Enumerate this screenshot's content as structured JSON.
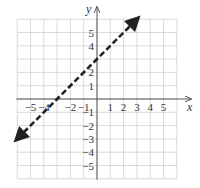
{
  "chart_data": {
    "type": "line",
    "title": "",
    "xlabel": "x",
    "ylabel": "y",
    "xlim": [
      -6,
      6
    ],
    "ylim": [
      -6,
      6
    ],
    "grid": true,
    "x_ticks": [
      -5,
      -4,
      -2,
      -1,
      1,
      2,
      3,
      4,
      5
    ],
    "x_tick_labels": [
      "−5",
      "−4",
      "−2",
      "−1",
      "1",
      "2",
      "3",
      "4",
      "5"
    ],
    "y_ticks": [
      5,
      4,
      2,
      1,
      -1,
      -2,
      -3,
      -4,
      -5
    ],
    "y_tick_labels": [
      "5",
      "4",
      "2",
      "1",
      "−1",
      "−2",
      "−3",
      "−4",
      "−5"
    ],
    "series": [
      {
        "name": "y = x + 3",
        "style": "dashed",
        "arrows": "both",
        "color": "#222222",
        "points": [
          [
            -6,
            -3
          ],
          [
            3,
            6
          ]
        ],
        "x_intercept": -3,
        "y_intercept": 3,
        "slope": 1
      }
    ]
  },
  "colors": {
    "grid": "#d0d0d0",
    "axis": "#555555",
    "line": "#222222"
  }
}
